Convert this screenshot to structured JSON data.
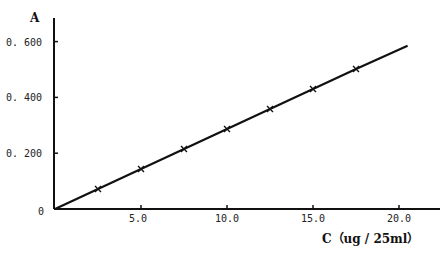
{
  "chart_data": {
    "type": "line",
    "title": "",
    "xlabel": "C（ug / 25ml）",
    "ylabel": "A",
    "xlim": [
      0,
      22
    ],
    "ylim": [
      0,
      0.65
    ],
    "x_ticks": [
      5.0,
      10.0,
      15.0,
      20.0
    ],
    "x_tick_labels": [
      "5.0",
      "10.0",
      "15.0",
      "20.0"
    ],
    "y_ticks": [
      0,
      0.2,
      0.4,
      0.6
    ],
    "y_tick_labels": [
      "0",
      "0. 200",
      "0. 400",
      "0. 600"
    ],
    "grid": false,
    "legend": null,
    "series": [
      {
        "name": "calibration",
        "x": [
          0,
          2.5,
          5.0,
          7.5,
          10.0,
          12.5,
          15.0,
          17.5,
          20.5
        ],
        "y": [
          0,
          0.072,
          0.143,
          0.215,
          0.287,
          0.358,
          0.43,
          0.502,
          0.585
        ]
      }
    ]
  },
  "labels": {
    "y_axis": "A",
    "x_axis": "C（ug / 25ml）",
    "origin": "0"
  }
}
